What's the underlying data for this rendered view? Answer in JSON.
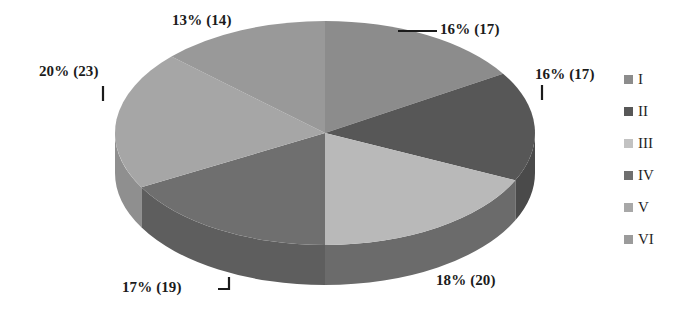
{
  "chart_data": {
    "type": "pie",
    "title": "",
    "subtitle": "",
    "xlabel": "",
    "ylabel": "",
    "total": 110,
    "legend_position": "right",
    "grid": false,
    "three_d": true,
    "categories": [
      "I",
      "II",
      "III",
      "IV",
      "V",
      "VI"
    ],
    "values": [
      17,
      17,
      20,
      19,
      23,
      14
    ],
    "percentages": [
      16,
      16,
      18,
      17,
      20,
      13
    ],
    "data_labels": [
      "16% (17)",
      "16% (17)",
      "18% (20)",
      "17% (19)",
      "20% (23)",
      "13% (14)"
    ],
    "colors": [
      "#8c8c8c",
      "#575757",
      "#b9b9b9",
      "#6f6f6f",
      "#a6a6a6",
      "#999999"
    ],
    "slices": [
      {
        "name": "I",
        "label": "16% (17)",
        "percent": 16,
        "count": 17,
        "color": "#8c8c8c",
        "side_color": "#7a7a7a",
        "start_deg": 0,
        "end_deg": 58
      },
      {
        "name": "II",
        "label": "16% (17)",
        "percent": 16,
        "count": 17,
        "color": "#575757",
        "side_color": "#4a4a4a",
        "start_deg": 58,
        "end_deg": 115
      },
      {
        "name": "III",
        "label": "18% (20)",
        "percent": 18,
        "count": 20,
        "color": "#b9b9b9",
        "side_color": "#6b6b6b",
        "start_deg": 115,
        "end_deg": 180
      },
      {
        "name": "IV",
        "label": "17% (19)",
        "percent": 17,
        "count": 19,
        "color": "#6f6f6f",
        "side_color": "#5e5e5e",
        "start_deg": 180,
        "end_deg": 241
      },
      {
        "name": "V",
        "label": "20% (23)",
        "percent": 20,
        "count": 23,
        "color": "#a6a6a6",
        "side_color": "#8f8f8f",
        "start_deg": 241,
        "end_deg": 313
      },
      {
        "name": "VI",
        "label": "13% (14)",
        "percent": 13,
        "count": 14,
        "color": "#999999",
        "side_color": "#858585",
        "start_deg": 313,
        "end_deg": 360
      }
    ]
  },
  "legend": {
    "items": [
      {
        "label": "I",
        "color": "#8c8c8c"
      },
      {
        "label": "II",
        "color": "#575757"
      },
      {
        "label": "III",
        "color": "#c2c2c2"
      },
      {
        "label": "IV",
        "color": "#6f6f6f"
      },
      {
        "label": "V",
        "color": "#a8a8a8"
      },
      {
        "label": "VI",
        "color": "#9b9b9b"
      }
    ]
  },
  "callouts": {
    "top_right": "16% (17)",
    "right": "16% (17)",
    "bottom_right": "18% (20)",
    "bottom_left": "17% (19)",
    "left": "20% (23)",
    "top_left": "13% (14)"
  }
}
